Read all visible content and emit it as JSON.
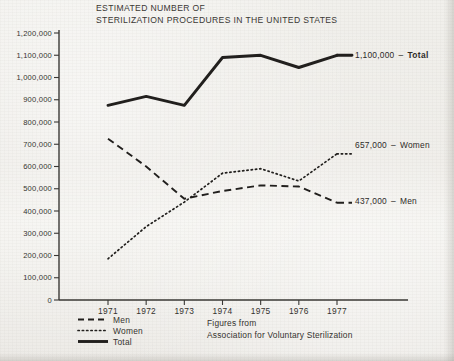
{
  "title": {
    "line1": "ESTIMATED NUMBER OF",
    "line2": "STERILIZATION PROCEDURES IN THE UNITED STATES"
  },
  "source": {
    "line1": "Figures from",
    "line2": "Association for Voluntary Sterilization"
  },
  "legend": {
    "men": "Men",
    "women": "Women",
    "total": "Total"
  },
  "end_labels": {
    "total_value": "1,100,000",
    "total_name": "Total",
    "women_value": "657,000",
    "women_name": "Women",
    "men_value": "437,000",
    "men_name": "Men",
    "dash": "–"
  },
  "axis": {
    "y_ticks": [
      "1,200,000",
      "1,100,000",
      "1,000,000",
      "900,000",
      "800,000",
      "700,000",
      "600,000",
      "500,000",
      "400,000",
      "300,000",
      "200,000",
      "100,000",
      "0"
    ],
    "x_ticks": [
      "1971",
      "1972",
      "1973",
      "1974",
      "1975",
      "1976",
      "1977"
    ]
  },
  "colors": {
    "ink": "#211f1d",
    "paper": "#efeeea",
    "axis": "#3a3835"
  },
  "chart_data": {
    "type": "line",
    "title": "ESTIMATED NUMBER OF STERILIZATION PROCEDURES IN THE UNITED STATES",
    "xlabel": "",
    "ylabel": "",
    "x": [
      1971,
      1972,
      1973,
      1974,
      1975,
      1976,
      1977
    ],
    "categories": [
      "1971",
      "1972",
      "1973",
      "1974",
      "1975",
      "1976",
      "1977"
    ],
    "xlim": [
      1971,
      1977
    ],
    "ylim": [
      0,
      1200000
    ],
    "ytick_step": 100000,
    "grid": false,
    "legend_position": "bottom-left",
    "series": [
      {
        "name": "Men",
        "style": "dashed",
        "values": [
          725000,
          600000,
          455000,
          490000,
          515000,
          510000,
          437000
        ],
        "end_label": "437,000"
      },
      {
        "name": "Women",
        "style": "dotted",
        "values": [
          185000,
          330000,
          440000,
          570000,
          590000,
          535000,
          657000
        ],
        "end_label": "657,000"
      },
      {
        "name": "Total",
        "style": "solid",
        "values": [
          875000,
          915000,
          875000,
          1090000,
          1100000,
          1045000,
          1100000
        ],
        "end_label": "1,100,000"
      }
    ],
    "annotations": [
      "Figures from",
      "Association for Voluntary Sterilization"
    ]
  }
}
